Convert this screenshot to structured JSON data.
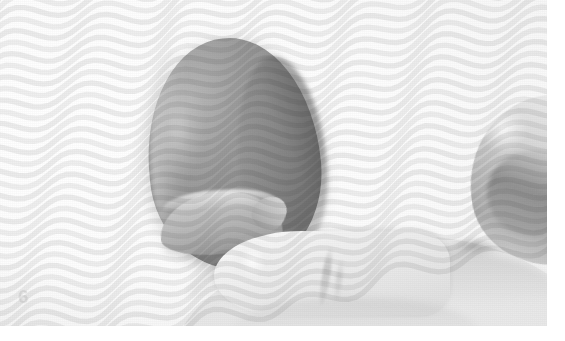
{
  "figure": {
    "number_label": "6",
    "color_mode": "grayscale",
    "width": 565,
    "height": 341
  },
  "palette": {
    "page_white": "#ffffff",
    "background_paper": "#fbfbfb",
    "background_shade": "#f2f2f2",
    "skin_light": "#f3f3f3",
    "skin_mid": "#e2e2e2",
    "skin_shadow": "#b4b4b4",
    "specimen_light": "#b7b7b7",
    "specimen_mid": "#9a9a9a",
    "specimen_dark": "#767676",
    "specimen_shadow": "#484848",
    "ripple_stroke": "#c9c9c9",
    "watermark": "rgba(150,150,150,0.22)"
  },
  "elements": {
    "specimen_name": "egg-specimen",
    "specimen_feature_name": "curved-hook-flipper",
    "finger_front_name": "index-finger-front",
    "finger_right_name": "thumb-right-edge",
    "palm_name": "palm-lower",
    "ripple_name": "ripple-wave-overlay",
    "grain_name": "halftone-grain-overlay"
  },
  "ripple": {
    "line_count": 46,
    "amplitude": 9,
    "wavelength": 96,
    "spacing": 11,
    "angle_deg": -14,
    "stroke_width": 5.5,
    "opacity_background": 0.3,
    "opacity_specimen": 0.55
  }
}
